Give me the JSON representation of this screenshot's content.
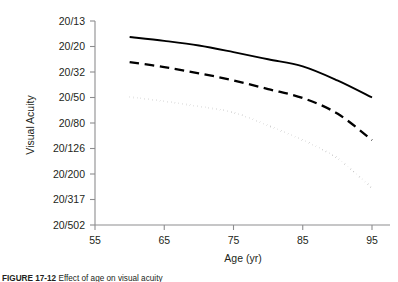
{
  "chart_data": {
    "type": "line",
    "title": "",
    "subtitle": "",
    "xlabel": "Age (yr)",
    "ylabel": "Visual Acuity",
    "grid": false,
    "legend_position": "none",
    "xlim": [
      55,
      98
    ],
    "ylim_index": [
      0,
      8
    ],
    "x_ticks": [
      55,
      65,
      75,
      85,
      95
    ],
    "x_tick_labels": [
      "55",
      "65",
      "75",
      "85",
      "95"
    ],
    "y_ticks": [
      0,
      1,
      2,
      3,
      4,
      5,
      6,
      7,
      8
    ],
    "y_tick_labels": [
      "20/13",
      "20/20",
      "20/32",
      "20/50",
      "20/80",
      "20/126",
      "20/200",
      "20/317",
      "20/502"
    ],
    "note": "y axis is an ordinal Snellen acuity scale, best acuity (20/13) at top, worst (20/502) at bottom; y values below are positions on that tick scale (0 = 20/13 ... 8 = 20/502)",
    "x": [
      60,
      65,
      70,
      75,
      80,
      85,
      90,
      95
    ],
    "series": [
      {
        "name": "upper-percentile-acuity",
        "style": "solid",
        "color": "#000000",
        "width": 1.9,
        "values": [
          0.63,
          0.78,
          0.96,
          1.22,
          1.5,
          1.78,
          2.33,
          3.0
        ]
      },
      {
        "name": "median-acuity",
        "style": "dashed",
        "color": "#000000",
        "width": 2.3,
        "values": [
          1.61,
          1.81,
          2.05,
          2.33,
          2.67,
          3.02,
          3.63,
          4.67
        ]
      },
      {
        "name": "lower-percentile-acuity",
        "style": "dotted",
        "color": "#000000",
        "width": 1.9,
        "values": [
          2.98,
          3.15,
          3.35,
          3.59,
          4.1,
          4.67,
          5.38,
          6.55
        ]
      }
    ]
  },
  "axes": {
    "y_axis_title": "Visual Acuity",
    "x_axis_title": "Age (yr)"
  },
  "caption": {
    "figure_number": "FIGURE 17-12",
    "text": "Effect of age on visual acuity"
  },
  "colors": {
    "line": "#000000",
    "spine": "#8d8d8f",
    "text": "#231f20",
    "background": "#ffffff"
  }
}
